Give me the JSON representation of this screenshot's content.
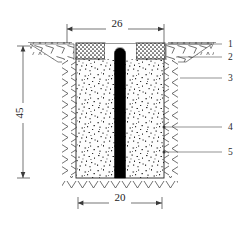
{
  "figure": {
    "background_color": "#ffffff",
    "line_color": "#222222",
    "pile_color": "#000000",
    "fill_color": "#fbfbfb"
  },
  "dimensions": {
    "top_width": {
      "value": "26",
      "name": "top-width-dimension",
      "orientation": "horizontal",
      "position": "top"
    },
    "depth": {
      "value": "45",
      "name": "depth-dimension",
      "orientation": "vertical",
      "position": "left"
    },
    "bottom_width": {
      "value": "20",
      "name": "bottom-width-dimension",
      "orientation": "horizontal",
      "position": "bottom"
    }
  },
  "callouts": [
    {
      "id": "1",
      "label": "1",
      "y": 44
    },
    {
      "id": "2",
      "label": "2",
      "y": 57
    },
    {
      "id": "3",
      "label": "3",
      "y": 78
    },
    {
      "id": "4",
      "label": "4",
      "y": 127
    },
    {
      "id": "5",
      "label": "5",
      "y": 152
    }
  ],
  "layers": {
    "ground_surface": "ground-surface-line",
    "top_cap_left": "stippled-cap-left",
    "top_cap_right": "stippled-cap-right",
    "backfill": "granular-backfill",
    "pile": "central-pile",
    "soil_left": "native-soil-left",
    "soil_right": "native-soil-right",
    "soil_bottom": "native-soil-bottom"
  }
}
